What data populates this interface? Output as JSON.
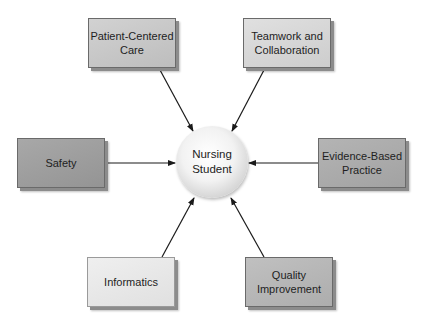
{
  "diagram": {
    "center": {
      "label_line1": "Nursing",
      "label_line2": "Student"
    },
    "nodes": [
      {
        "id": "patient-centered-care",
        "line1": "Patient-Centered",
        "line2": "Care",
        "fill": "#c4c4c4"
      },
      {
        "id": "teamwork-and-collaboration",
        "line1": "Teamwork and",
        "line2": "Collaboration",
        "fill": "#d6d6d6"
      },
      {
        "id": "safety",
        "line1": "Safety",
        "line2": "",
        "fill": "#9e9e9e"
      },
      {
        "id": "evidence-based-practice",
        "line1": "Evidence-Based",
        "line2": "Practice",
        "fill": "#ababab"
      },
      {
        "id": "informatics",
        "line1": "Informatics",
        "line2": "",
        "fill": "#e8e8e8"
      },
      {
        "id": "quality-improvement",
        "line1": "Quality",
        "line2": "Improvement",
        "fill": "#b6b6b6"
      }
    ],
    "edges": [
      {
        "from": "patient-centered-care",
        "to": "nursing-student"
      },
      {
        "from": "teamwork-and-collaboration",
        "to": "nursing-student"
      },
      {
        "from": "safety",
        "to": "nursing-student"
      },
      {
        "from": "evidence-based-practice",
        "to": "nursing-student"
      },
      {
        "from": "informatics",
        "to": "nursing-student"
      },
      {
        "from": "quality-improvement",
        "to": "nursing-student"
      }
    ],
    "colors": {
      "arrow": "#1a1a1a",
      "border": "#6a6a6a"
    }
  }
}
